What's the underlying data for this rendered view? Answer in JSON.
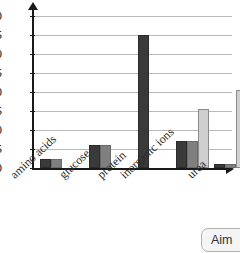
{
  "chart_data": {
    "type": "bar",
    "title": "",
    "xlabel": "",
    "ylabel": "",
    "ylim": [
      0,
      40
    ],
    "ytick_step": 5,
    "yticks": [
      0,
      5,
      10,
      15,
      20,
      25,
      30,
      35,
      40
    ],
    "grid": true,
    "legend": "none",
    "categories": [
      "amino acids",
      "glucose",
      "protein",
      "inorganic ions",
      "urea"
    ],
    "series": [
      {
        "name": "series-1-dark",
        "color": "#3a3a3a",
        "values": [
          2.5,
          6,
          35,
          7,
          1
        ]
      },
      {
        "name": "series-2-medium",
        "color": "#7f7f7f",
        "values": [
          2.5,
          6,
          null,
          7,
          1
        ]
      },
      {
        "name": "series-3-light",
        "color": "#cfcfcf",
        "values": [
          null,
          null,
          null,
          15.5,
          20.5
        ]
      }
    ]
  },
  "axis": {
    "y_tick_labels": [
      "40",
      "35",
      "30",
      "25",
      "20",
      "15",
      "10",
      "5",
      "0"
    ]
  },
  "overlay": {
    "aim_button_label": "Aim"
  }
}
